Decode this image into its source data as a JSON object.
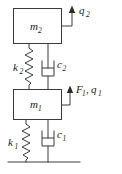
{
  "diagram": {
    "stroke_color": "#3a3a3a",
    "text_color": "#1a1a1a",
    "background": "#ffffff",
    "masses": [
      {
        "id": "m2",
        "symbol": "m",
        "subscript": "2",
        "label": "m2",
        "x": 13,
        "y": 8,
        "width": 49,
        "height": 36
      },
      {
        "id": "m1",
        "symbol": "m",
        "subscript": "1",
        "label": "m1",
        "x": 13,
        "y": 89,
        "width": 49,
        "height": 31
      }
    ],
    "springs": [
      {
        "id": "k2",
        "symbol": "k",
        "subscript": "2",
        "label": "k2",
        "label_x": 14,
        "label_y": 70
      },
      {
        "id": "k1",
        "symbol": "k",
        "subscript": "1",
        "label": "k1",
        "label_x": 9,
        "label_y": 145
      }
    ],
    "dampers": [
      {
        "id": "c2",
        "symbol": "c",
        "subscript": "2",
        "label": "c2",
        "label_x": 57,
        "label_y": 67
      },
      {
        "id": "c1",
        "symbol": "c",
        "subscript": "1",
        "label": "c1",
        "label_x": 57,
        "label_y": 137
      }
    ],
    "arrows": [
      {
        "id": "q2",
        "direction": "up",
        "label": "q2",
        "symbol": "q",
        "subscript": "2",
        "label_x": 79,
        "label_y": 14
      },
      {
        "id": "F1-q1",
        "direction": "up",
        "label": "F1, q1",
        "symbol_force": "F",
        "subscript_force": "1",
        "separator": ",",
        "symbol_disp": "q",
        "subscript_disp": "1",
        "label_x": 74,
        "label_y": 94
      }
    ],
    "ground": {
      "id": "ground",
      "label": "ground-line",
      "x1": 8,
      "x2": 80,
      "y": 162
    }
  }
}
